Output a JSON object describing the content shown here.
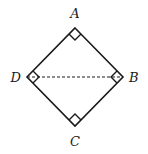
{
  "figure": {
    "type": "square-diagram",
    "stroke_color": "#1a1a1a",
    "background": "#ffffff"
  },
  "vertices": {
    "A": {
      "label": "A",
      "x": 75,
      "y": 28
    },
    "B": {
      "label": "B",
      "x": 123,
      "y": 77
    },
    "C": {
      "label": "C",
      "x": 75,
      "y": 126
    },
    "D": {
      "label": "D",
      "x": 27,
      "y": 77
    }
  },
  "labels": {
    "A": "A",
    "B": "B",
    "C": "C",
    "D": "D"
  },
  "segments": [
    {
      "from": "A",
      "to": "B",
      "style": "solid"
    },
    {
      "from": "B",
      "to": "C",
      "style": "solid"
    },
    {
      "from": "C",
      "to": "D",
      "style": "solid"
    },
    {
      "from": "D",
      "to": "A",
      "style": "solid"
    },
    {
      "from": "D",
      "to": "B",
      "style": "dashed"
    }
  ],
  "right_angle_marks": [
    "A",
    "B",
    "C",
    "D"
  ]
}
